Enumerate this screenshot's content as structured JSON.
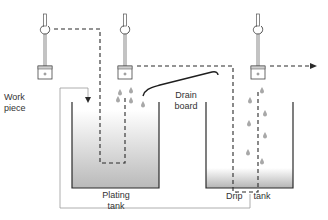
{
  "labels": {
    "work_piece_line1": "Work",
    "work_piece_line2": "piece",
    "drain_board_line1": "Drain",
    "drain_board_line2": "board",
    "plating_tank_line1": "Plating",
    "plating_tank_line2": "tank",
    "drip_tank_word1": "Drip",
    "drip_tank_word2": "tank"
  },
  "components": [
    {
      "name": "hoist-hook-1",
      "type": "hook-with-workpiece",
      "position": "left, above plating tank"
    },
    {
      "name": "hoist-hook-2",
      "type": "hook-with-workpiece",
      "position": "middle, dripping onto drain board"
    },
    {
      "name": "hoist-hook-3",
      "type": "hook-with-workpiece",
      "position": "right, above drip tank"
    },
    {
      "name": "plating-tank",
      "type": "tank",
      "fill": "solution gradient (full)"
    },
    {
      "name": "drip-tank",
      "type": "tank",
      "fill": "shallow collected drippings"
    },
    {
      "name": "drain-board",
      "type": "sloped board between tanks"
    },
    {
      "name": "return-line",
      "type": "pipe from drip tank back to plating tank"
    }
  ],
  "colors": {
    "line": "#2a2a2a",
    "tank_fill_top": "#ffffff",
    "tank_fill_bottom": "#b8b8b8",
    "drop": "#a8a8a8",
    "return_line": "#9a9a9a"
  }
}
